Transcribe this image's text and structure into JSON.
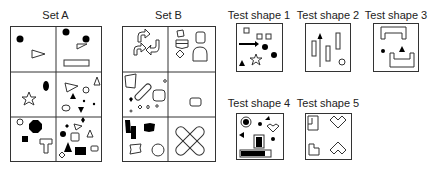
{
  "sets": {
    "set_a": {
      "title": "Set A"
    },
    "set_b": {
      "title": "Set B"
    }
  },
  "tests": [
    {
      "title": "Test shape 1"
    },
    {
      "title": "Test shape 2"
    },
    {
      "title": "Test shape 3"
    },
    {
      "title": "Test shape 4"
    },
    {
      "title": "Test shape 5"
    }
  ],
  "colors": {
    "stroke": "#333333",
    "fill": "#000000",
    "background": "#ffffff"
  }
}
